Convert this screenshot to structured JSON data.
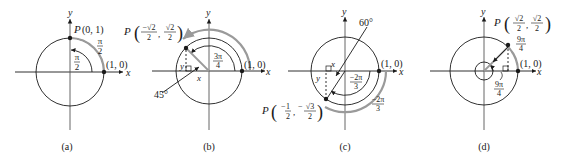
{
  "figure": {
    "panels": [
      {
        "id": "a",
        "caption": "(a)",
        "axis_x": "x",
        "axis_y": "y",
        "point_P_label": "P",
        "point_P_coords": "(0, 1)",
        "point_unit_label": "(1, 0)",
        "arc_outer_num": "π",
        "arc_outer_den": "2",
        "arc_inner_num": "π",
        "arc_inner_den": "2"
      },
      {
        "id": "b",
        "caption": "(b)",
        "axis_x": "x",
        "axis_y": "y",
        "point_P_label": "P",
        "point_P_x_num": "−√2",
        "point_P_x_den": "2",
        "point_P_y_num": "√2",
        "point_P_y_den": "2",
        "point_unit_label": "(1, 0)",
        "arc_inner_num": "3π",
        "arc_inner_den": "4",
        "ref_angle": "45°",
        "leg_x": "x",
        "leg_y": "y"
      },
      {
        "id": "c",
        "caption": "(c)",
        "axis_x": "x",
        "axis_y": "y",
        "point_P_label": "P",
        "point_P_x_num": "1",
        "point_P_x_den": "2",
        "point_P_y_num": "√3",
        "point_P_y_den": "2",
        "point_unit_label": "(1, 0)",
        "arc_inner_num": "−2π",
        "arc_inner_den": "3",
        "arc_outer_num": "−2π",
        "arc_outer_den": "3",
        "ref_angle": "60°",
        "leg_x": "x",
        "leg_y": "y"
      },
      {
        "id": "d",
        "caption": "(d)",
        "axis_x": "x",
        "axis_y": "y",
        "point_P_label": "P",
        "point_P_x_num": "√2",
        "point_P_x_den": "2",
        "point_P_y_num": "√2",
        "point_P_y_den": "2",
        "point_unit_label": "(1, 0)",
        "arc_outer_num": "9π",
        "arc_outer_den": "4",
        "arc_inner_num": "9π",
        "arc_inner_den": "4"
      }
    ],
    "colors": {
      "ink": "#1a1a1a",
      "arc_gray": "#9a9a9a",
      "axis_gray": "#555555"
    }
  }
}
